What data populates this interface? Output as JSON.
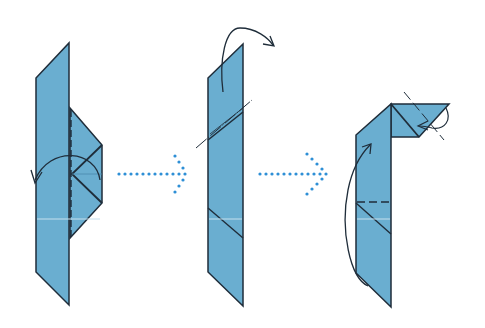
{
  "diagram": {
    "type": "origami-fold-sequence",
    "steps": [
      {
        "index": 1,
        "description": "Valley fold right flap over to the left along dashed line",
        "symbols": [
          "valley-fold-line",
          "fold-over-arrow"
        ]
      },
      {
        "index": 2,
        "description": "Fold top section backward along diagonal line",
        "symbols": [
          "mountain-fold-line",
          "fold-behind-arrow"
        ]
      },
      {
        "index": 3,
        "description": "Fold tip inward and fold lower section upward along dashed line",
        "symbols": [
          "valley-fold-line",
          "fold-up-arrow",
          "tuck-arrow"
        ]
      }
    ],
    "arrows_between_steps": 2
  },
  "colors": {
    "paper": "#6aaed0",
    "paper_edge": "#1f2d3a",
    "arrow_dots": "#2e8fd6",
    "background": "#ffffff"
  }
}
